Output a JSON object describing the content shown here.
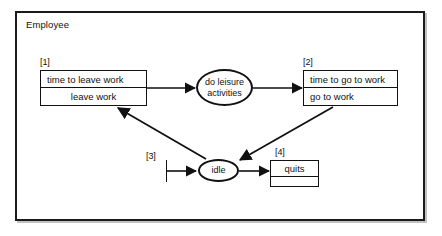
{
  "frame": {
    "title": "Employee"
  },
  "tags": {
    "one": "[1]",
    "two": "[2]",
    "three": "[3]",
    "four": "[4]"
  },
  "nodes": {
    "box_leave_work": {
      "tag": "[1]",
      "trigger": "time to leave work",
      "action": "leave work"
    },
    "activity_leisure": {
      "line1": "do leisure",
      "line2": "activities"
    },
    "box_go_to_work": {
      "tag": "[2]",
      "trigger": "time to go to work",
      "action": "go to work"
    },
    "activity_idle": {
      "label": "idle"
    },
    "box_quits": {
      "tag": "[4]",
      "trigger": "quits",
      "action": ""
    },
    "initial_state": {
      "tag": "[3]"
    }
  },
  "edges": [
    {
      "name": "leave-work-to-leisure",
      "from": "box_leave_work",
      "to": "activity_leisure"
    },
    {
      "name": "leisure-to-go-to-work",
      "from": "activity_leisure",
      "to": "box_go_to_work"
    },
    {
      "name": "go-to-work-to-idle",
      "from": "box_go_to_work",
      "to": "activity_idle"
    },
    {
      "name": "idle-to-leave-work",
      "from": "activity_idle",
      "to": "box_leave_work"
    },
    {
      "name": "initial-to-idle",
      "from": "initial_state",
      "to": "activity_idle"
    },
    {
      "name": "idle-to-quits",
      "from": "activity_idle",
      "to": "box_quits"
    }
  ],
  "colors": {
    "stroke": "#111111",
    "background": "#ffffff"
  }
}
